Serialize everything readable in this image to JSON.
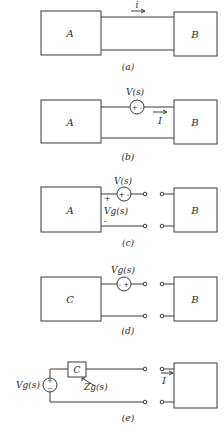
{
  "figure": {
    "panels": [
      {
        "id": "a",
        "caption": "(a)",
        "left_box": "A",
        "right_box": "B",
        "current_label": "i"
      },
      {
        "id": "b",
        "caption": "(b)",
        "left_box": "A",
        "right_box": "B",
        "source_label": "V(s)",
        "source_polarity": "+ -",
        "current_label": "I"
      },
      {
        "id": "c",
        "caption": "(c)",
        "left_box": "A",
        "right_box": "B",
        "source_label": "V(s)",
        "source_polarity": "+ -",
        "port_voltage_label": "Vg(s)",
        "port_plus": "+",
        "port_minus": "-"
      },
      {
        "id": "d",
        "caption": "(d)",
        "left_box": "C",
        "right_box": "B",
        "source_label": "Vg(s)",
        "source_polarity": "- +"
      },
      {
        "id": "e",
        "caption": "(e)",
        "impedance_box": "C",
        "right_box": "B",
        "source_label": "Vg(s)",
        "source_polarity": "+ -",
        "impedance_label": "Zg(s)",
        "current_label": "I"
      }
    ]
  }
}
